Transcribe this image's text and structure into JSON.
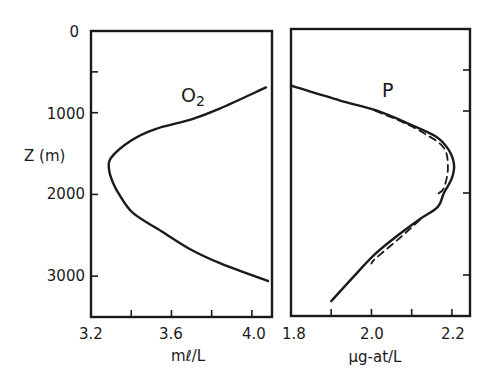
{
  "chart_data": [
    {
      "type": "line",
      "panel": "left",
      "title": "",
      "series_label": "O2",
      "xlabel": "mℓ/L",
      "ylabel": "Z (m)",
      "xlim": [
        3.2,
        4.1
      ],
      "ylim": [
        3500,
        0
      ],
      "x_ticks": [
        3.2,
        3.4,
        3.6,
        3.8,
        4.0
      ],
      "x_tick_labels": [
        "3.2",
        "3.6",
        "4.0"
      ],
      "y_ticks": [
        0,
        500,
        1000,
        2000,
        3000
      ],
      "y_tick_labels": [
        "0",
        "1000",
        "2000",
        "3000"
      ],
      "grid": false,
      "series": [
        {
          "name": "O2",
          "style": "solid",
          "x": [
            4.07,
            3.84,
            3.7,
            3.52,
            3.4,
            3.3,
            3.29,
            3.31,
            3.34,
            3.41,
            3.55,
            3.7,
            3.85,
            4.08
          ],
          "z": [
            690,
            950,
            1080,
            1200,
            1340,
            1550,
            1700,
            1860,
            2000,
            2230,
            2450,
            2680,
            2850,
            3060
          ]
        }
      ]
    },
    {
      "type": "line",
      "panel": "right",
      "title": "",
      "series_label": "P",
      "xlabel": "µg-at/L",
      "ylabel": "",
      "xlim": [
        1.8,
        2.245
      ],
      "ylim": [
        3500,
        0
      ],
      "x_ticks": [
        1.8,
        1.9,
        2.0,
        2.1,
        2.2
      ],
      "x_tick_labels": [
        "1.8",
        "2.0",
        "2.2"
      ],
      "y_ticks": [
        500,
        1000,
        2000,
        3000
      ],
      "grid": false,
      "series": [
        {
          "name": "P (observed)",
          "style": "solid",
          "x": [
            1.8,
            1.92,
            2.01,
            2.09,
            2.16,
            2.19,
            2.205,
            2.2,
            2.18,
            2.165,
            2.12,
            2.07,
            2.01,
            1.95,
            1.9
          ],
          "z": [
            690,
            870,
            990,
            1150,
            1310,
            1460,
            1640,
            1820,
            2000,
            2170,
            2320,
            2500,
            2740,
            3050,
            3320
          ]
        },
        {
          "name": "P (model)",
          "style": "dashed",
          "x": [
            2.01,
            2.07,
            2.13,
            2.18,
            2.19,
            2.18,
            2.165
          ],
          "z": [
            1000,
            1120,
            1270,
            1450,
            1700,
            1940,
            2010
          ]
        },
        {
          "name": "P (model, lower)",
          "style": "dashed",
          "x": [
            2.12,
            2.07,
            2.01,
            2.0
          ],
          "z": [
            2330,
            2550,
            2800,
            2860
          ]
        }
      ]
    }
  ],
  "labels": {
    "y_axis_title": "Z (m)",
    "left_series": "O",
    "left_series_sub": "2",
    "right_series": "P",
    "left_x_unit": "mℓ/L",
    "right_x_unit": "µg-at/L",
    "left_y_ticks": [
      "0",
      "1000",
      "2000",
      "3000"
    ],
    "left_x_ticks": [
      "3.2",
      "3.6",
      "4.0"
    ],
    "right_x_ticks": [
      "1.8",
      "2.0",
      "2.2"
    ]
  }
}
